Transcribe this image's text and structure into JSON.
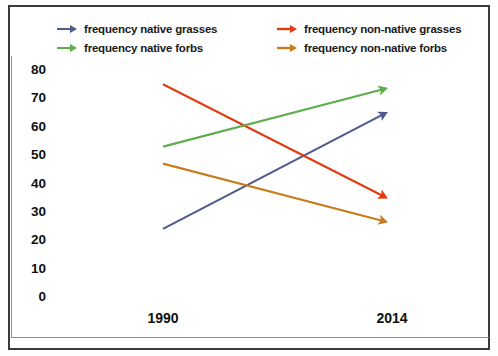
{
  "chart_data": {
    "type": "line",
    "title": "",
    "xlabel": "",
    "ylabel": "",
    "categories": [
      "1990",
      "2014"
    ],
    "x": [
      1990,
      2014
    ],
    "ylim": [
      0,
      80
    ],
    "yticks": [
      80,
      70,
      60,
      50,
      40,
      30,
      20,
      10,
      0
    ],
    "grid": false,
    "legend_position": "top",
    "series": [
      {
        "name": "frequency native grasses",
        "color": "#4f5b8e",
        "marker": "arrow",
        "values": [
          24,
          66
        ]
      },
      {
        "name": "frequency non-native grasses",
        "color": "#e03c11",
        "marker": "arrow",
        "values": [
          75,
          34
        ]
      },
      {
        "name": "frequency native forbs",
        "color": "#5fad4e",
        "marker": "arrow",
        "values": [
          53,
          74
        ]
      },
      {
        "name": "frequency non-native forbs",
        "color": "#c87d1c",
        "marker": "arrow",
        "values": [
          47,
          26
        ]
      }
    ]
  },
  "legend": {
    "items": [
      {
        "label": "frequency native grasses",
        "color": "#4f5b8e",
        "icon": "arrow-right-icon"
      },
      {
        "label": "frequency native forbs",
        "color": "#5fad4e",
        "icon": "arrow-right-icon"
      },
      {
        "label": "frequency non-native grasses",
        "color": "#e03c11",
        "icon": "arrow-right-icon"
      },
      {
        "label": "frequency non-native forbs",
        "color": "#c87d1c",
        "icon": "arrow-right-icon"
      }
    ]
  },
  "axes": {
    "y_labels": [
      "80",
      "70",
      "60",
      "50",
      "40",
      "30",
      "20",
      "10",
      "0"
    ],
    "x_labels": [
      "1990",
      "2014"
    ]
  }
}
